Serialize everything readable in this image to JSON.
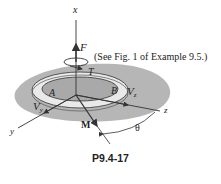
{
  "figure": {
    "caption": "P9.4-17",
    "note": "(See Fig. 1 of Example 9.5.)",
    "labels": {
      "x_axis": "x",
      "y_axis": "y",
      "z_axis": "z",
      "force": "F",
      "torque": "T",
      "moment": "M",
      "point_a": "A",
      "point_b": "B",
      "shear_y": "V",
      "shear_y_sub": "y",
      "shear_z": "V",
      "shear_z_sub": "z",
      "angle": "θ"
    },
    "colors": {
      "plate_fill": "#a9a9a9",
      "ring_fill": "#e9e9e9",
      "line": "#333333",
      "background": "#ffffff"
    }
  }
}
